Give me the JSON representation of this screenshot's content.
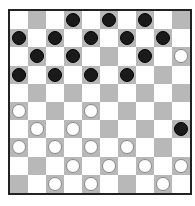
{
  "board": {
    "size": 10,
    "colors": {
      "light": "#ffffff",
      "dark": "#b8b8b8",
      "black_piece": "#1a1a1a",
      "white_piece": "#ffffff"
    },
    "rows": [
      "...b.b.b..",
      "b.b.b.b.b.",
      ".b.b...b.w",
      "b.b.b.b...",
      "..........",
      "w...w.....",
      ".w.w.....b",
      "w.w.w.w...",
      "...w.w.w.w",
      "..w.w...w."
    ]
  }
}
